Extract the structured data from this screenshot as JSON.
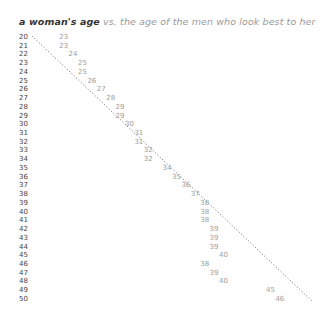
{
  "title": {
    "strong": "a woman's age",
    "rest": " vs. the age of the men who look best to her"
  },
  "colors": {
    "title_strong": "#333333",
    "title_rest": "#9a9a9a",
    "row_label": "#444444",
    "value": "#9d9d9d",
    "reference_line": "#555555"
  },
  "chart_data": {
    "type": "table",
    "title": "a woman's age vs. the age of the men who look best to her",
    "xlabel": "age of the men who look best to her",
    "ylabel": "a woman's age",
    "reference_line": "dotted diagonal y = x (same age)",
    "x": [
      20,
      21,
      22,
      23,
      24,
      25,
      26,
      27,
      28,
      29,
      30,
      31,
      32,
      33,
      34,
      35,
      36,
      37,
      38,
      39,
      40,
      41,
      42,
      43,
      44,
      45,
      46,
      47,
      48,
      49,
      50
    ],
    "values": [
      23,
      23,
      24,
      25,
      25,
      26,
      27,
      28,
      29,
      29,
      30,
      31,
      31,
      32,
      32,
      34,
      35,
      36,
      37,
      38,
      38,
      38,
      39,
      39,
      39,
      40,
      38,
      39,
      40,
      45,
      46
    ],
    "series": [
      {
        "name": "age of men who look best",
        "values": [
          23,
          23,
          24,
          25,
          25,
          26,
          27,
          28,
          29,
          29,
          30,
          31,
          31,
          32,
          32,
          34,
          35,
          36,
          37,
          38,
          38,
          38,
          39,
          39,
          39,
          40,
          38,
          39,
          40,
          45,
          46
        ]
      }
    ]
  }
}
